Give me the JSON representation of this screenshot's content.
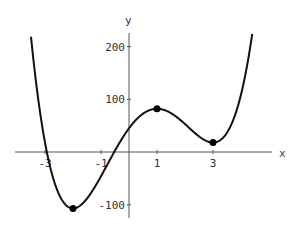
{
  "chart_data": {
    "type": "line",
    "title": "",
    "xlabel": "x",
    "ylabel": "y",
    "function": "3x^4 - 8x^3 - 30x^2 + 72x + 45",
    "xlim": [
      -4.1,
      4.8
    ],
    "ylim": [
      -130,
      230
    ],
    "x_ticks": [
      -3,
      -1,
      1,
      3
    ],
    "x_tick_labels": [
      "-3",
      "-1",
      "1",
      "3"
    ],
    "y_ticks": [
      -100,
      100,
      200
    ],
    "y_tick_labels": [
      "-100",
      "100",
      "200"
    ],
    "grid": false,
    "legend": null,
    "critical_points": [
      {
        "x": -2,
        "y": -107,
        "kind": "local minimum"
      },
      {
        "x": 1,
        "y": 82,
        "kind": "local maximum"
      },
      {
        "x": 3,
        "y": 18,
        "kind": "local minimum"
      }
    ],
    "series": [
      {
        "name": "f(x)",
        "color": "#000000"
      }
    ]
  }
}
